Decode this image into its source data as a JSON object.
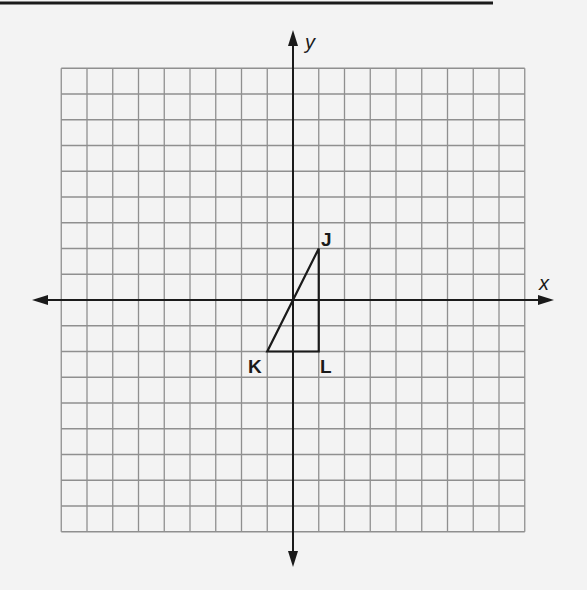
{
  "diagram": {
    "type": "coordinate-plane",
    "grid": {
      "x_min": -9,
      "x_max": 9,
      "y_min": -9,
      "y_max": 9,
      "step": 1,
      "line_color": "#8f8f8f"
    },
    "axes": {
      "x_label": "x",
      "y_label": "y",
      "color": "#1a1a1a"
    },
    "shape": {
      "name": "triangle JKL",
      "vertices": [
        {
          "label": "J",
          "x": 1,
          "y": 2
        },
        {
          "label": "K",
          "x": -1,
          "y": -2
        },
        {
          "label": "L",
          "x": 1,
          "y": -2
        }
      ],
      "stroke": "#1a1a1a"
    }
  }
}
